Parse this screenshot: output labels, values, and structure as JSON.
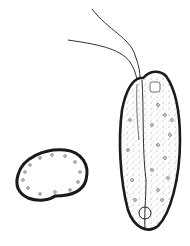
{
  "figure": {
    "cells": [
      {
        "id": "elongated-cell",
        "features": [
          "two-flagella",
          "granular-cytoplasm",
          "longitudinal-groove",
          "nucleus"
        ]
      },
      {
        "id": "rounded-cell",
        "features": [
          "granular-periphery",
          "clear-center"
        ]
      }
    ],
    "colors": {
      "ink": "#1a1a1a",
      "paper": "#ffffff",
      "stipple": "#555555"
    }
  }
}
